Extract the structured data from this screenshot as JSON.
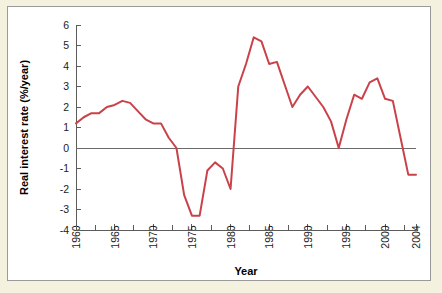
{
  "chart_data": {
    "type": "line",
    "title": "",
    "xlabel": "Year",
    "ylabel": "Real interest rate (%/year)",
    "xlim": [
      1960,
      2004
    ],
    "ylim": [
      -4,
      6
    ],
    "grid": false,
    "legend": false,
    "line_color": "#c9424a",
    "axis_color": "#5b5b5b",
    "zero_line": 0,
    "xticks": [
      1960,
      1965,
      1970,
      1975,
      1980,
      1985,
      1990,
      1995,
      2000,
      2004
    ],
    "xtick_labels": [
      "1960",
      "1965",
      "1970",
      "1975",
      "1980",
      "1985",
      "1990",
      "1995",
      "2000",
      "2004"
    ],
    "xminor_step": 2.5,
    "yticks": [
      6,
      5,
      4,
      3,
      2,
      1,
      0,
      -1,
      -2,
      -3,
      -4
    ],
    "ytick_labels": [
      "6",
      "5",
      "4",
      "3",
      "2",
      "1",
      "0",
      "-1",
      "-2",
      "-3",
      "-4"
    ],
    "series": [
      {
        "name": "Real interest rate",
        "x": [
          1960,
          1961,
          1962,
          1963,
          1964,
          1965,
          1966,
          1967,
          1968,
          1969,
          1970,
          1971,
          1972,
          1973,
          1974,
          1975,
          1976,
          1977,
          1978,
          1979,
          1980,
          1981,
          1982,
          1983,
          1984,
          1985,
          1986,
          1987,
          1988,
          1989,
          1990,
          1991,
          1992,
          1993,
          1994,
          1995,
          1996,
          1997,
          1998,
          1999,
          2000,
          2001,
          2002,
          2003,
          2004
        ],
        "values": [
          1.2,
          1.5,
          1.7,
          1.7,
          2.0,
          2.1,
          2.3,
          2.2,
          1.8,
          1.4,
          1.2,
          1.2,
          0.5,
          0.0,
          -2.3,
          -3.3,
          -3.3,
          -1.1,
          -0.7,
          -1.0,
          -2.0,
          3.0,
          4.1,
          5.4,
          5.2,
          4.1,
          4.2,
          3.1,
          2.0,
          2.6,
          3.0,
          2.5,
          2.0,
          1.3,
          0.0,
          1.4,
          2.6,
          2.4,
          3.2,
          3.4,
          2.4,
          2.3,
          0.5,
          -1.3,
          -1.3
        ]
      }
    ]
  }
}
